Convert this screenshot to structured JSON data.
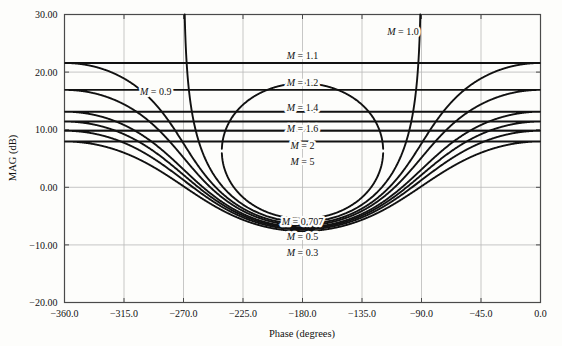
{
  "chart_data": {
    "type": "line",
    "title": "",
    "xlabel": "Phase (degrees)",
    "ylabel": "MAG (dB)",
    "xlim": [
      -360.0,
      0.0
    ],
    "ylim": [
      -20.0,
      30.0
    ],
    "xticks": [
      -360.0,
      -315.0,
      -270.0,
      -225.0,
      -180.0,
      -135.0,
      -90.0,
      -45.0,
      0.0
    ],
    "xtick_labels": [
      "-360.0",
      "-315.0",
      "-270.0",
      "-225.0",
      "-180.0",
      "-135.0",
      "-90.0",
      "-45.0",
      "0.0"
    ],
    "yticks": [
      -20.0,
      -10.0,
      0.0,
      10.0,
      20.0,
      30.0
    ],
    "ytick_labels": [
      "-20.00",
      "-10.00",
      "0.00",
      "10.00",
      "20.00",
      "30.00"
    ],
    "grid": true,
    "legend": "none",
    "series": [
      {
        "name": "M = 0.3",
        "m": 0.3,
        "label": "M = 0.3",
        "label_x": -180.0,
        "label_y": -12.0,
        "closed": false
      },
      {
        "name": "M = 0.5",
        "m": 0.5,
        "label": "M = 0.5",
        "label_x": -180.0,
        "label_y": -9.2,
        "closed": false
      },
      {
        "name": "M = 0.707",
        "m": 0.707,
        "label": "M = 0.707",
        "label_x": -180.0,
        "label_y": -6.6,
        "closed": false
      },
      {
        "name": "M = 0.9",
        "m": 0.9,
        "label": "M = 0.9",
        "label_x": -291.0,
        "label_y": 16.0,
        "closed": false
      },
      {
        "name": "M = 1.0",
        "m": 1.0,
        "label": "M = 1.0",
        "label_x": -104.0,
        "label_y": 26.5,
        "closed": false
      },
      {
        "name": "M = 1.1",
        "m": 1.1,
        "label": "M = 1.1",
        "label_x": -180.0,
        "label_y": 22.2,
        "closed": true
      },
      {
        "name": "M = 1.2",
        "m": 1.2,
        "label": "M = 1.2",
        "label_x": -180.0,
        "label_y": 17.6,
        "closed": true
      },
      {
        "name": "M = 1.4",
        "m": 1.4,
        "label": "M = 1.4",
        "label_x": -180.0,
        "label_y": 13.3,
        "closed": true
      },
      {
        "name": "M = 1.6",
        "m": 1.6,
        "label": "M = 1.6",
        "label_x": -180.0,
        "label_y": 9.6,
        "closed": true
      },
      {
        "name": "M = 2",
        "m": 2.0,
        "label": "M = 2",
        "label_x": -180.0,
        "label_y": 6.7,
        "closed": true
      },
      {
        "name": "M = 5",
        "m": 5.0,
        "label": "M = 5",
        "label_x": -180.0,
        "label_y": 3.9,
        "closed": true
      }
    ],
    "line_color": "#111111",
    "grid_color": "#b9b9b9",
    "frame_color": "#4a4a4a",
    "background": "#fdfdfb"
  }
}
